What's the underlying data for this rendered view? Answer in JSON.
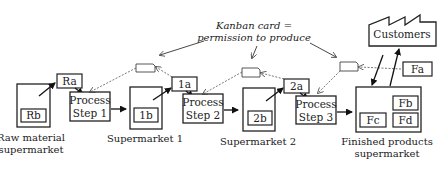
{
  "diagram": {
    "type": "kanban-pull-system",
    "callout": {
      "line1": "Kanban card =",
      "line2": "permission to produce"
    },
    "customers": {
      "label": "Customers"
    },
    "supermarkets": [
      {
        "id": "raw",
        "caption_line1": "Raw material",
        "caption_line2": "supermarket",
        "items": [
          "Rb"
        ]
      },
      {
        "id": "s1",
        "caption_line1": "Supermarket 1",
        "caption_line2": "",
        "items": [
          "1b"
        ]
      },
      {
        "id": "s2",
        "caption_line1": "Supermarket 2",
        "caption_line2": "",
        "items": [
          "2b"
        ]
      },
      {
        "id": "fin",
        "caption_line1": "Finished products",
        "caption_line2": "supermarket",
        "items": [
          "Fb",
          "Fc",
          "Fd"
        ]
      }
    ],
    "withdrawn_items": [
      "Ra",
      "1a",
      "2a",
      "Fa"
    ],
    "process_steps": [
      {
        "line1": "Process",
        "line2": "Step 1"
      },
      {
        "line1": "Process",
        "line2": "Step 2"
      },
      {
        "line1": "Process",
        "line2": "Step 3"
      }
    ],
    "kanban_cards": 3,
    "colors": {
      "stroke": "#222222",
      "background": "#ffffff",
      "dashed": "#555555"
    }
  }
}
